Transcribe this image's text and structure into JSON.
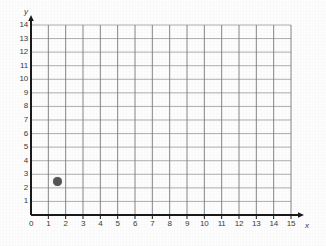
{
  "chart_data": {
    "type": "scatter",
    "title": "",
    "xlabel": "x",
    "ylabel": "y",
    "xlim": [
      0,
      15
    ],
    "ylim": [
      0,
      14
    ],
    "grid": true,
    "legend": "none",
    "x_ticks": [
      "0",
      "1",
      "2",
      "3",
      "4",
      "5",
      "6",
      "7",
      "8",
      "9",
      "10",
      "11",
      "12",
      "13",
      "14",
      "15"
    ],
    "y_ticks": [
      "1",
      "2",
      "3",
      "4",
      "5",
      "6",
      "7",
      "8",
      "9",
      "10",
      "11",
      "12",
      "13",
      "14"
    ],
    "points": [
      {
        "label": "plotted-point",
        "x": 1.5,
        "y": 2.5
      }
    ],
    "colors": {
      "point": "#555555",
      "axis": "#1a1a1a",
      "gridline": "#8c8c8c",
      "background": "#fdfdfd",
      "tick_text": "#3a3a3a"
    }
  }
}
